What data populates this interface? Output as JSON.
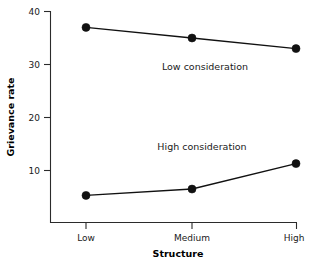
{
  "chart_data": {
    "type": "line",
    "title": "",
    "xlabel": "Structure",
    "ylabel": "Grievance rate",
    "categories": [
      "Low",
      "Medium",
      "High"
    ],
    "x_tick_labels": [
      "Low",
      "Medium",
      "High"
    ],
    "y_tick_labels": [
      "10",
      "20",
      "30",
      "40"
    ],
    "y_ticks": [
      10,
      20,
      30,
      40
    ],
    "ylim": [
      0,
      40
    ],
    "grid": false,
    "legend_position": "inline-annotations",
    "series": [
      {
        "name": "Low consideration",
        "values": [
          37,
          35,
          33
        ],
        "annotation": "Low consideration",
        "color": "#111111"
      },
      {
        "name": "High consideration",
        "values": [
          5.3,
          6.5,
          11.3
        ],
        "annotation": "High consideration",
        "color": "#111111"
      }
    ],
    "annotations": [
      {
        "text": "Low consideration",
        "series": "Low consideration"
      },
      {
        "text": "High consideration",
        "series": "High consideration"
      }
    ]
  },
  "axes": {
    "x_title": "Structure",
    "y_title": "Grievance rate"
  },
  "ticks": {
    "y": {
      "t40": "40",
      "t30": "30",
      "t20": "20",
      "t10": "10"
    },
    "x": {
      "low": "Low",
      "medium": "Medium",
      "high": "High"
    }
  },
  "labels": {
    "low_consideration": "Low consideration",
    "high_consideration": "High consideration"
  },
  "colors": {
    "line": "#111111",
    "axis": "#2b2b2b",
    "text": "#1a1a1a",
    "background": "#ffffff"
  }
}
